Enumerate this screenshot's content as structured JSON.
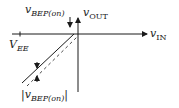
{
  "diagram": {
    "type": "transfer-characteristic",
    "x_axis_label": {
      "main": "v",
      "sub": "IN"
    },
    "y_axis_label": {
      "main": "v",
      "sub": "OUT"
    },
    "supply_label": {
      "main": "V",
      "sub": "EE"
    },
    "top_annotation": {
      "main": "v",
      "sub": "BEP(on)"
    },
    "bottom_annotation": {
      "prefix": "|",
      "main": "v",
      "sub": "BEP(on)",
      "suffix": "|"
    },
    "colors": {
      "line": "#1a1a1a",
      "background": "#ffffff"
    }
  }
}
